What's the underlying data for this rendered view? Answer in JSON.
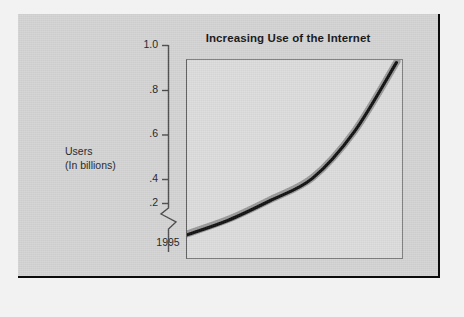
{
  "slide": {
    "background_color": "#d4d4d4",
    "frame_color": "#0a0a0a"
  },
  "chart_data": {
    "type": "line",
    "title": "Increasing Use of the Internet",
    "xlabel": "",
    "ylabel": "Users\n(In billions)",
    "ylabel_line1": "Users",
    "ylabel_line2": "(In billions)",
    "categories": [
      "1995",
      "1996",
      "1997",
      "1998",
      "1999",
      "2000"
    ],
    "x": [
      1995,
      1996,
      1997,
      1998,
      1999,
      2000
    ],
    "values": [
      0.3,
      0.36,
      0.44,
      0.53,
      0.72,
      1.0
    ],
    "series": [
      {
        "name": "Users (In billions)",
        "values": [
          0.3,
          0.36,
          0.44,
          0.53,
          0.72,
          1.0
        ],
        "line_color": "#111111",
        "shadow_color": "#9a9a9a"
      }
    ],
    "ylim": [
      0.2,
      1.0
    ],
    "yticks": [
      0.2,
      0.4,
      0.6,
      0.8,
      1.0
    ],
    "ytick_labels": [
      ".2",
      ".4",
      ".6",
      ".8",
      "1.0"
    ],
    "xticks": [
      1995,
      1996,
      1997,
      1998,
      1999,
      2000
    ],
    "xtick_labels": [
      "1995",
      "1996",
      "1997",
      "1998",
      "1999",
      "2000"
    ],
    "grid": false,
    "legend": "none",
    "axis_break": true,
    "axis_break_note": "zigzag break on y-axis below .2",
    "plot_background": "#dcdcdc"
  },
  "ticks": {
    "y": [
      {
        "label": "1.0",
        "value": 1.0
      },
      {
        "label": ".8",
        "value": 0.8
      },
      {
        "label": ".6",
        "value": 0.6
      },
      {
        "label": ".4",
        "value": 0.4
      },
      {
        "label": ".2",
        "value": 0.2
      }
    ],
    "x": [
      {
        "label": "1995"
      },
      {
        "label": "1996"
      },
      {
        "label": "1997"
      },
      {
        "label": "1998"
      },
      {
        "label": "1999"
      },
      {
        "label": "2000"
      }
    ]
  }
}
